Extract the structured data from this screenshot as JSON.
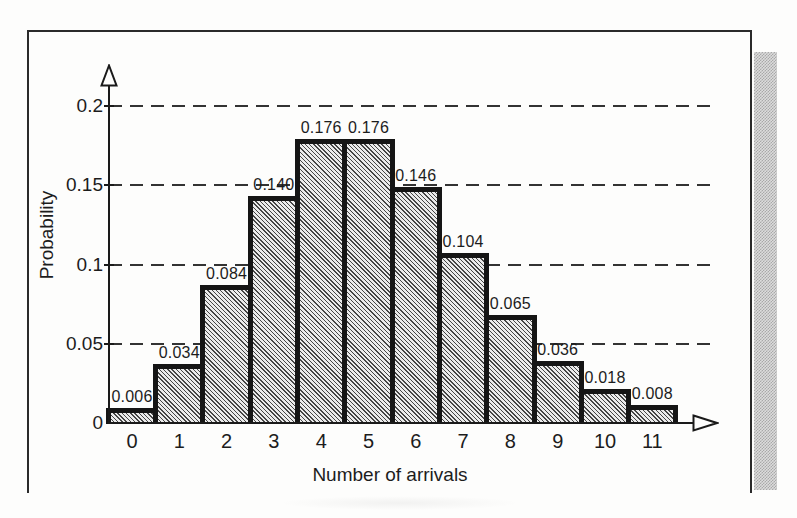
{
  "figure": {
    "background_color": "#fdfdfc",
    "frame_color": "#2b2b2b",
    "page_edge_colors": {
      "dark": "#a8a8a8",
      "light": "#dcdcdc"
    }
  },
  "chart_data": {
    "type": "bar",
    "title": "",
    "xlabel": "Number of arrivals",
    "ylabel": "Probability",
    "categories": [
      "0",
      "1",
      "2",
      "3",
      "4",
      "5",
      "6",
      "7",
      "8",
      "9",
      "10",
      "11"
    ],
    "values": [
      0.006,
      0.034,
      0.084,
      0.14,
      0.176,
      0.176,
      0.146,
      0.104,
      0.065,
      0.036,
      0.018,
      0.008
    ],
    "bar_value_labels": [
      "0.006",
      "0.034",
      "0.084",
      "0.140",
      "0.176",
      "0.176",
      "0.146",
      "0.104",
      "0.065",
      "0.036",
      "0.018",
      "0.008"
    ],
    "y_ticks": [
      {
        "label": "0",
        "value": 0
      },
      {
        "label": "0.05",
        "value": 0.05
      },
      {
        "label": "0.1",
        "value": 0.1
      },
      {
        "label": "0.15",
        "value": 0.15
      },
      {
        "label": "0.2",
        "value": 0.2
      }
    ],
    "ylim": [
      0,
      0.21
    ],
    "grid": "dashed horizontal lines at 0.05, 0.1, 0.15, 0.2",
    "legend": "none",
    "hatch": "diagonal backslash hatching inside bars",
    "colors": {
      "bar_fill": "#ebebeb",
      "hatch_line": "#454545",
      "bar_outline": "#151515",
      "gridline": "#333333",
      "axis": "#1a1a1a",
      "text": "#1c1c1c"
    }
  }
}
